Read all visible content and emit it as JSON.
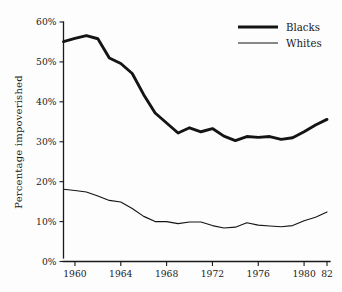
{
  "chart_data": {
    "type": "line",
    "title": "",
    "subtitle": "",
    "xlabel": "",
    "ylabel": "Percentage impoverished",
    "xlim": [
      1959,
      1982
    ],
    "ylim": [
      0,
      60
    ],
    "grid": false,
    "legend_position": "top-right",
    "x_tick_labels": [
      "1960",
      "1964",
      "1968",
      "1972",
      "1976",
      "1980",
      "82"
    ],
    "x_tick_values": [
      1960,
      1964,
      1968,
      1972,
      1976,
      1980,
      1982
    ],
    "y_tick_labels": [
      "0%",
      "10%",
      "20%",
      "30%",
      "40%",
      "50%",
      "60%"
    ],
    "y_tick_values": [
      0,
      10,
      20,
      30,
      40,
      50,
      60
    ],
    "x": [
      1959,
      1960,
      1961,
      1962,
      1963,
      1964,
      1965,
      1966,
      1967,
      1968,
      1969,
      1970,
      1971,
      1972,
      1973,
      1974,
      1975,
      1976,
      1977,
      1978,
      1979,
      1980,
      1981,
      1982
    ],
    "series": [
      {
        "name": "Blacks",
        "line_weight": "thick",
        "values": [
          55.1,
          55.9,
          56.6,
          55.8,
          51.0,
          49.6,
          47.1,
          41.8,
          37.2,
          34.7,
          32.2,
          33.5,
          32.5,
          33.3,
          31.4,
          30.3,
          31.3,
          31.1,
          31.3,
          30.6,
          31.0,
          32.5,
          34.2,
          35.6
        ]
      },
      {
        "name": "Whites",
        "line_weight": "thin",
        "values": [
          18.1,
          17.8,
          17.4,
          16.4,
          15.3,
          14.9,
          13.3,
          11.3,
          10.0,
          10.0,
          9.5,
          9.9,
          9.9,
          9.0,
          8.4,
          8.6,
          9.7,
          9.1,
          8.9,
          8.7,
          9.0,
          10.2,
          11.1,
          12.4
        ]
      }
    ],
    "legend": [
      {
        "label": "Blacks",
        "line_weight": "thick"
      },
      {
        "label": "Whites",
        "line_weight": "thin"
      }
    ]
  }
}
